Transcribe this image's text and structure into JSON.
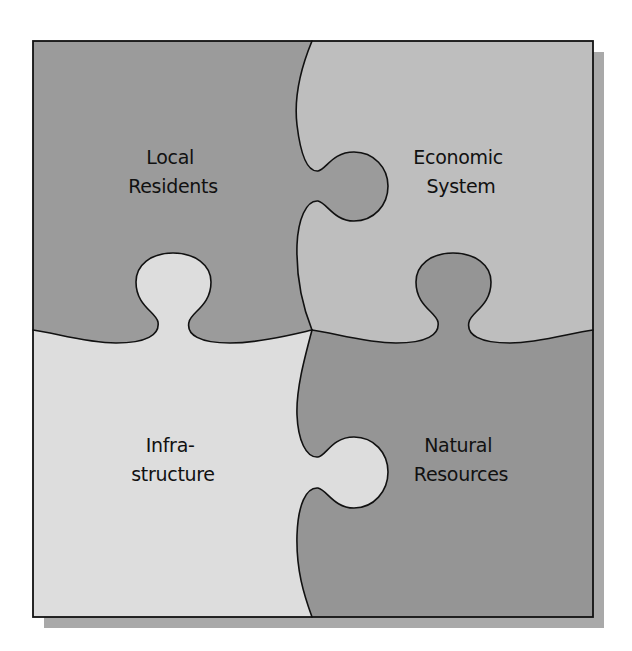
{
  "diagram": {
    "type": "jigsaw-puzzle",
    "pieces": [
      {
        "id": "local-residents",
        "position": "top-left",
        "lines": [
          "Local",
          "Residents"
        ],
        "color": "#9b9b9b"
      },
      {
        "id": "economic-system",
        "position": "top-right",
        "lines": [
          "Economic",
          "System"
        ],
        "color": "#bebebe"
      },
      {
        "id": "infrastructure",
        "position": "bottom-left",
        "lines": [
          "Infra-",
          "structure"
        ],
        "color": "#dddddd"
      },
      {
        "id": "natural-resources",
        "position": "bottom-right",
        "lines": [
          "Natural",
          "Resources"
        ],
        "color": "#959595"
      }
    ],
    "frame": {
      "border_color": "#111111",
      "shadow_color": "#a9a9a9"
    }
  }
}
